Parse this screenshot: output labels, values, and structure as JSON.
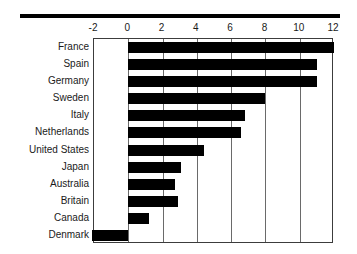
{
  "chart_data": {
    "type": "bar",
    "orientation": "horizontal",
    "title": "",
    "subtitle": "",
    "xlabel": "",
    "ylabel": "",
    "xlim": [
      -2,
      12
    ],
    "ylim": null,
    "grid": true,
    "grid_axis": "x",
    "legend": false,
    "legend_position": "none",
    "bar_color": "#000000",
    "axis_color": "#3c3c3c",
    "gridline_color": "#6a6a6a",
    "background": "#ffffff",
    "xticks": [
      -2,
      0,
      2,
      4,
      6,
      8,
      10,
      12
    ],
    "xtick_labels": [
      "-2",
      "0",
      "2",
      "4",
      "6",
      "8",
      "10",
      "12"
    ],
    "categories": [
      "France",
      "Spain",
      "Germany",
      "Sweden",
      "Italy",
      "Netherlands",
      "United States",
      "Japan",
      "Australia",
      "Britain",
      "Canada",
      "Denmark"
    ],
    "values": [
      12.0,
      11.0,
      11.0,
      8.0,
      6.8,
      6.6,
      4.4,
      3.1,
      2.7,
      2.9,
      1.2,
      -2.1
    ],
    "series": [
      {
        "name": "value",
        "values": [
          12.0,
          11.0,
          11.0,
          8.0,
          6.8,
          6.6,
          4.4,
          3.1,
          2.7,
          2.9,
          1.2,
          -2.1
        ]
      }
    ],
    "annotations": []
  },
  "decorations": {
    "top_rule": true
  }
}
